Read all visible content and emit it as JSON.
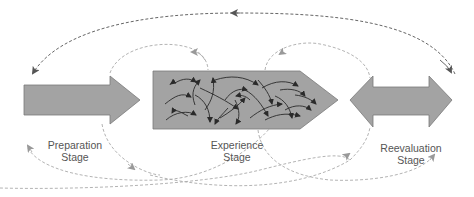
{
  "diagram": {
    "stages": [
      {
        "id": "preparation",
        "line1": "Preparation",
        "line2": "Stage",
        "shape": "right-arrow"
      },
      {
        "id": "experience",
        "line1": "Experience",
        "line2": "Stage",
        "shape": "pentagon-with-random-arrows"
      },
      {
        "id": "reevaluation",
        "line1": "Reevaluation",
        "line2": "Stage",
        "shape": "double-arrow"
      }
    ],
    "connectors": [
      {
        "from": "reevaluation",
        "to": "preparation",
        "style": "dashed",
        "description": "long top feedback arc"
      },
      {
        "from": "preparation",
        "to": "experience",
        "style": "dashed-light",
        "description": "upper loop"
      },
      {
        "from": "experience",
        "to": "reevaluation",
        "style": "dashed-light",
        "description": "upper loop"
      },
      {
        "from": "preparation",
        "to": "reevaluation",
        "style": "dashed-light",
        "description": "lower loops"
      }
    ],
    "colors": {
      "shape_fill": "#a3a3a3",
      "shape_stroke": "#7a7a7a",
      "inner_arrows": "#333333",
      "top_arc": "#666666",
      "loops": "#aaaaaa",
      "label_text": "#555555"
    }
  }
}
